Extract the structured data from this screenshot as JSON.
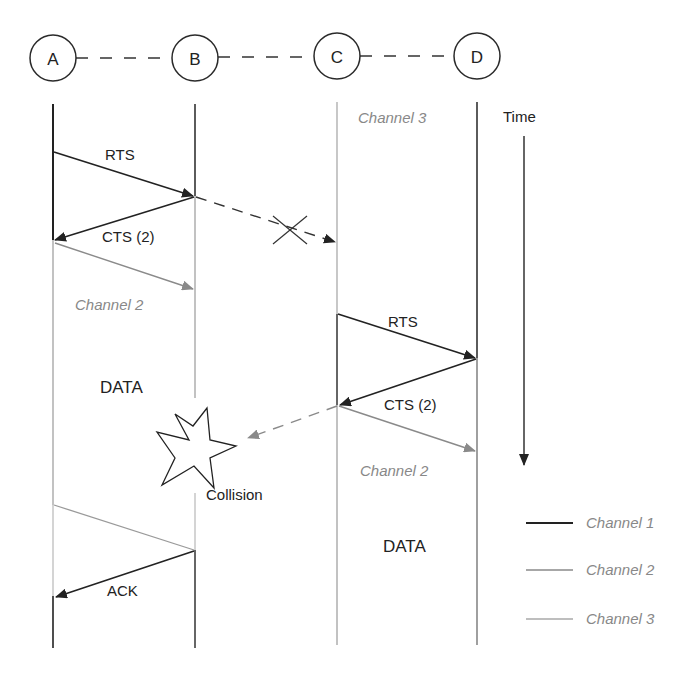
{
  "colors": {
    "channel1": "#2a2a2a",
    "channel2": "#9a9a9a",
    "channel3": "#b0b0b0",
    "text_dark": "#222222",
    "text_channel": "#888888"
  },
  "nodes": [
    {
      "id": "A",
      "label": "A",
      "cx": 53,
      "cy": 58
    },
    {
      "id": "B",
      "label": "B",
      "cx": 195,
      "cy": 58
    },
    {
      "id": "C",
      "label": "C",
      "cx": 337,
      "cy": 56
    },
    {
      "id": "D",
      "label": "D",
      "cx": 477,
      "cy": 56
    }
  ],
  "labels": {
    "channel3_top": "Channel 3",
    "time": "Time",
    "rts_ab": "RTS",
    "cts_ba": "CTS (2)",
    "channel2_left": "Channel 2",
    "data_left": "DATA",
    "rts_cd": "RTS",
    "cts_dc": "CTS (2)",
    "channel2_right": "Channel 2",
    "collision": "Collision",
    "data_right": "DATA",
    "ack": "ACK"
  },
  "legend": [
    {
      "label": "Channel 1",
      "color": "#2a2a2a"
    },
    {
      "label": "Channel 2",
      "color": "#9a9a9a"
    },
    {
      "label": "Channel 3",
      "color": "#b0b0b0"
    }
  ]
}
